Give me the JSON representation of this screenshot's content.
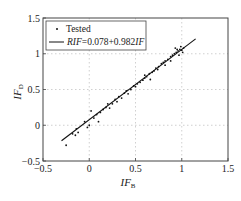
{
  "chart_data": {
    "type": "scatter",
    "title": "",
    "xlabel": "IF_B",
    "ylabel": "IF_D",
    "xlabel_main": "IF",
    "xlabel_sub": "B",
    "ylabel_main": "IF",
    "ylabel_sub": "D",
    "xlim": [
      -0.5,
      1.5
    ],
    "ylim": [
      -0.5,
      1.5
    ],
    "xticks": [
      -0.5,
      0,
      0.5,
      1,
      1.5
    ],
    "yticks": [
      -0.5,
      0,
      0.5,
      1,
      1.5
    ],
    "xtick_labels": [
      "−0.5",
      "0",
      "0.5",
      "1",
      "1.5"
    ],
    "ytick_labels": [
      "−0.5",
      "0",
      "0.5",
      "1",
      "1.5"
    ],
    "grid": true,
    "legend_position": "upper left",
    "legend": [
      "Tested",
      "RIF=0.078+0.982IF"
    ],
    "legend_fit_prefix": "RIF",
    "legend_fit_mid": "=0.078+0.982",
    "legend_fit_suffix": "IF",
    "series": [
      {
        "name": "Tested",
        "kind": "scatter",
        "points": [
          [
            -0.25,
            -0.28
          ],
          [
            -0.18,
            -0.12
          ],
          [
            -0.15,
            -0.14
          ],
          [
            -0.12,
            -0.1
          ],
          [
            -0.14,
            -0.05
          ],
          [
            -0.05,
            0.05
          ],
          [
            -0.02,
            -0.03
          ],
          [
            0.0,
            0.0
          ],
          [
            0.02,
            0.2
          ],
          [
            0.05,
            0.1
          ],
          [
            0.08,
            0.15
          ],
          [
            0.1,
            0.05
          ],
          [
            0.12,
            0.18
          ],
          [
            0.15,
            0.22
          ],
          [
            0.18,
            0.25
          ],
          [
            0.2,
            0.3
          ],
          [
            0.22,
            0.24
          ],
          [
            0.25,
            0.3
          ],
          [
            0.28,
            0.36
          ],
          [
            0.3,
            0.33
          ],
          [
            0.32,
            0.4
          ],
          [
            0.35,
            0.38
          ],
          [
            0.38,
            0.45
          ],
          [
            0.4,
            0.48
          ],
          [
            0.42,
            0.44
          ],
          [
            0.45,
            0.5
          ],
          [
            0.48,
            0.55
          ],
          [
            0.5,
            0.54
          ],
          [
            0.52,
            0.58
          ],
          [
            0.55,
            0.6
          ],
          [
            0.58,
            0.63
          ],
          [
            0.6,
            0.66
          ],
          [
            0.62,
            0.68
          ],
          [
            0.65,
            0.72
          ],
          [
            0.68,
            0.74
          ],
          [
            0.7,
            0.76
          ],
          [
            0.72,
            0.8
          ],
          [
            0.75,
            0.82
          ],
          [
            0.78,
            0.86
          ],
          [
            0.8,
            0.88
          ],
          [
            0.82,
            0.9
          ],
          [
            0.85,
            0.92
          ],
          [
            0.88,
            0.96
          ],
          [
            0.9,
            0.98
          ],
          [
            0.92,
            1.0
          ],
          [
            0.94,
            1.02
          ],
          [
            0.96,
            1.04
          ],
          [
            0.98,
            1.06
          ],
          [
            1.0,
            1.05
          ],
          [
            1.02,
            1.08
          ],
          [
            0.93,
            1.08
          ],
          [
            0.97,
            0.98
          ],
          [
            1.01,
            1.02
          ],
          [
            0.95,
            1.06
          ],
          [
            0.99,
            1.1
          ],
          [
            0.6,
            0.7
          ],
          [
            0.66,
            0.64
          ],
          [
            0.74,
            0.78
          ],
          [
            0.82,
            0.84
          ],
          [
            0.88,
            0.9
          ]
        ]
      },
      {
        "name": "RIF=0.078+0.982IF",
        "kind": "line",
        "intercept": 0.078,
        "slope": 0.982,
        "x_range": [
          -0.3,
          1.15
        ]
      }
    ]
  }
}
